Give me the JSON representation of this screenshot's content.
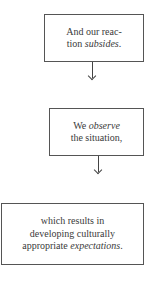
{
  "diagram": {
    "type": "flowchart",
    "direction": "top-to-bottom",
    "nodes": [
      {
        "id": "reaction",
        "lines": [
          {
            "text": "And our reac-"
          },
          {
            "pre": "tion ",
            "em": "subsides",
            "post": "."
          }
        ]
      },
      {
        "id": "observe",
        "lines": [
          {
            "pre": "We ",
            "em": "observe",
            "post": ""
          },
          {
            "text": "the situation,"
          }
        ]
      },
      {
        "id": "expectations",
        "lines": [
          {
            "text": "which results in"
          },
          {
            "text": "developing culturally"
          },
          {
            "pre": "appropriate ",
            "em": "expectations",
            "post": "."
          }
        ]
      }
    ],
    "edges": [
      {
        "from": "reaction",
        "to": "observe"
      },
      {
        "from": "observe",
        "to": "expectations"
      }
    ],
    "colors": {
      "border": "#555555",
      "text": "#3a3a3a",
      "background": "#ffffff"
    }
  }
}
